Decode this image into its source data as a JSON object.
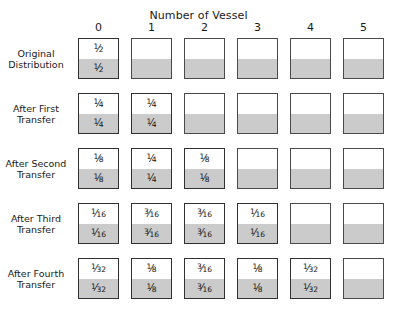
{
  "chart_data": {
    "type": "table",
    "title": "Number of Vessel",
    "xlabel": "Number of Vessel",
    "ylabel": "",
    "categories": [
      "0",
      "1",
      "2",
      "3",
      "4",
      "5"
    ],
    "row_labels": [
      "Original Distribution",
      "After First Transfer",
      "After Second Transfer",
      "After Third Transfer",
      "After Fourth Transfer"
    ],
    "fill_fraction": 0.5,
    "legend": [],
    "grid": false,
    "rows": [
      {
        "label_lines": [
          "Original",
          "Distribution"
        ],
        "cells": [
          {
            "value": "1/2",
            "num": "1",
            "den": "2",
            "labeled": true
          },
          {
            "value": "",
            "num": "",
            "den": "",
            "labeled": false
          },
          {
            "value": "",
            "num": "",
            "den": "",
            "labeled": false
          },
          {
            "value": "",
            "num": "",
            "den": "",
            "labeled": false
          },
          {
            "value": "",
            "num": "",
            "den": "",
            "labeled": false
          },
          {
            "value": "",
            "num": "",
            "den": "",
            "labeled": false
          }
        ]
      },
      {
        "label_lines": [
          "After First",
          "Transfer"
        ],
        "cells": [
          {
            "value": "1/4",
            "num": "1",
            "den": "4",
            "labeled": true
          },
          {
            "value": "1/4",
            "num": "1",
            "den": "4",
            "labeled": true
          },
          {
            "value": "",
            "num": "",
            "den": "",
            "labeled": false
          },
          {
            "value": "",
            "num": "",
            "den": "",
            "labeled": false
          },
          {
            "value": "",
            "num": "",
            "den": "",
            "labeled": false
          },
          {
            "value": "",
            "num": "",
            "den": "",
            "labeled": false
          }
        ]
      },
      {
        "label_lines": [
          "After Second",
          "Transfer"
        ],
        "cells": [
          {
            "value": "1/8",
            "num": "1",
            "den": "8",
            "labeled": true
          },
          {
            "value": "1/4",
            "num": "1",
            "den": "4",
            "labeled": true
          },
          {
            "value": "1/8",
            "num": "1",
            "den": "8",
            "labeled": true
          },
          {
            "value": "",
            "num": "",
            "den": "",
            "labeled": false
          },
          {
            "value": "",
            "num": "",
            "den": "",
            "labeled": false
          },
          {
            "value": "",
            "num": "",
            "den": "",
            "labeled": false
          }
        ]
      },
      {
        "label_lines": [
          "After Third",
          "Transfer"
        ],
        "cells": [
          {
            "value": "1/16",
            "num": "1",
            "den": "16",
            "labeled": true
          },
          {
            "value": "3/16",
            "num": "3",
            "den": "16",
            "labeled": true
          },
          {
            "value": "3/16",
            "num": "3",
            "den": "16",
            "labeled": true
          },
          {
            "value": "1/16",
            "num": "1",
            "den": "16",
            "labeled": true
          },
          {
            "value": "",
            "num": "",
            "den": "",
            "labeled": false
          },
          {
            "value": "",
            "num": "",
            "den": "",
            "labeled": false
          }
        ]
      },
      {
        "label_lines": [
          "After Fourth",
          "Transfer"
        ],
        "cells": [
          {
            "value": "1/32",
            "num": "1",
            "den": "32",
            "labeled": true
          },
          {
            "value": "1/8",
            "num": "1",
            "den": "8",
            "labeled": true
          },
          {
            "value": "3/16",
            "num": "3",
            "den": "16",
            "labeled": true
          },
          {
            "value": "1/8",
            "num": "1",
            "den": "8",
            "labeled": true
          },
          {
            "value": "1/32",
            "num": "1",
            "den": "32",
            "labeled": true
          },
          {
            "value": "",
            "num": "",
            "den": "",
            "labeled": false
          }
        ]
      }
    ]
  },
  "colors": {
    "fill_gray": "#cbcbcb",
    "border_dark": "#303030",
    "border_light": "#4a4a4a",
    "text": "#1a1a1a",
    "background": "#ffffff"
  },
  "layout": {
    "col_left_positions": [
      78,
      131,
      184,
      237,
      290,
      343
    ],
    "row_top_positions": [
      38,
      93,
      148,
      203,
      258
    ],
    "cell_size": 41
  }
}
